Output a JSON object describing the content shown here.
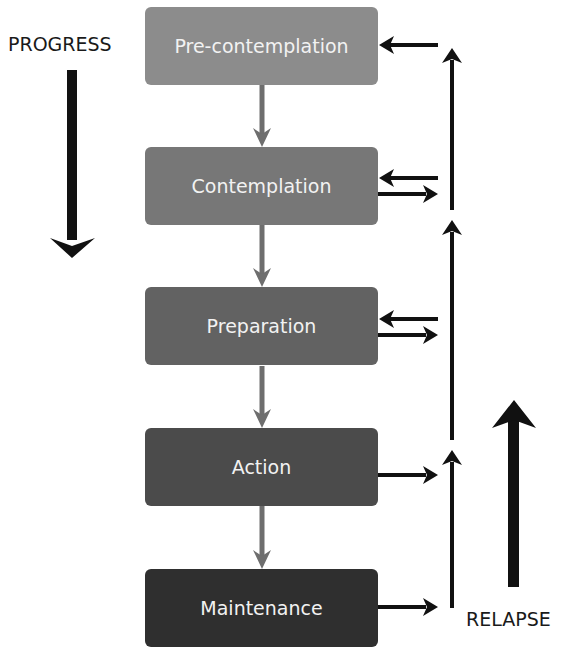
{
  "diagram": {
    "labels": {
      "progress": "PROGRESS",
      "relapse": "RELAPSE"
    },
    "stages": [
      {
        "name": "Pre-contemplation",
        "color": "#8c8c8c",
        "top": 7
      },
      {
        "name": "Contemplation",
        "color": "#777777",
        "top": 147
      },
      {
        "name": "Preparation",
        "color": "#626262",
        "top": 287
      },
      {
        "name": "Action",
        "color": "#4b4b4b",
        "top": 428
      },
      {
        "name": "Maintenance",
        "color": "#2f2f2f",
        "top": 569
      }
    ],
    "connectors": {
      "down_arrow_color": "#6e6e6e",
      "relapse_arrow_color": "#111111"
    }
  }
}
